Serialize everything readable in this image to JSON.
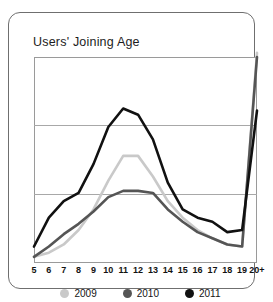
{
  "card": {
    "title": "Users' Joining Age"
  },
  "legend": [
    {
      "label": "2009",
      "color": "#c9c9c9"
    },
    {
      "label": "2010",
      "color": "#555555"
    },
    {
      "label": "2011",
      "color": "#111111"
    }
  ],
  "chart_data": {
    "type": "line",
    "title": "Users' Joining Age",
    "xlabel": "",
    "ylabel": "",
    "grid": true,
    "legend_position": "bottom",
    "ylim": [
      0,
      100
    ],
    "yticks": [
      0,
      33,
      67,
      100
    ],
    "categories": [
      "5",
      "6",
      "7",
      "8",
      "9",
      "10",
      "11",
      "12",
      "13",
      "14",
      "15",
      "16",
      "17",
      "18",
      "19",
      "20+"
    ],
    "series": [
      {
        "name": "2009",
        "color": "#c9c9c9",
        "values": [
          3,
          5,
          9,
          16,
          26,
          40,
          52,
          52,
          42,
          30,
          22,
          16,
          12,
          9,
          8,
          102
        ]
      },
      {
        "name": "2010",
        "color": "#555555",
        "values": [
          3,
          8,
          14,
          19,
          25,
          32,
          35,
          35,
          34,
          26,
          20,
          15,
          12,
          9,
          8,
          100
        ]
      },
      {
        "name": "2011",
        "color": "#111111",
        "values": [
          8,
          22,
          30,
          34,
          48,
          66,
          75,
          72,
          60,
          39,
          26,
          22,
          20,
          15,
          16,
          74
        ]
      }
    ]
  }
}
